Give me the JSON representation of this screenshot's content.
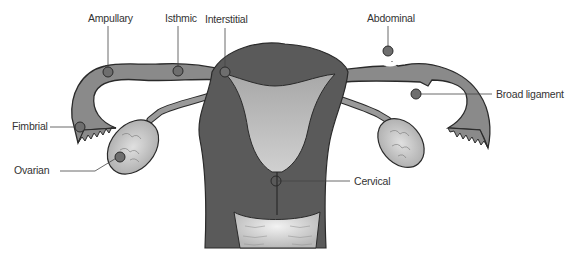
{
  "diagram": {
    "labels": {
      "ampullary": "Ampullary",
      "isthmic": "Isthmic",
      "interstitial": "Interstitial",
      "abdominal": "Abdominal",
      "broad_ligament": "Broad ligament",
      "fimbrial": "Fimbrial",
      "ovarian": "Ovarian",
      "cervical": "Cervical"
    },
    "colors": {
      "uterus_wall": "#5a5a5a",
      "tube": "#8a8a8a",
      "cavity": "#b5b5b5",
      "ovary": "#c8c8c8",
      "site_dot": "#6e6e6e",
      "outline": "#2a2a2a",
      "label_text": "#333333"
    }
  }
}
